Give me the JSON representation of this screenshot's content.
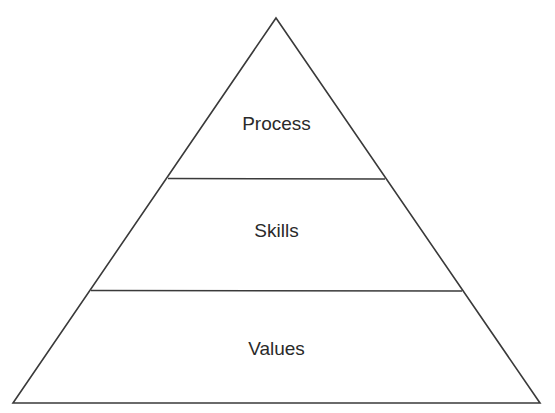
{
  "diagram": {
    "type": "pyramid",
    "tiers": [
      {
        "label": "Process",
        "position": "top"
      },
      {
        "label": "Skills",
        "position": "middle"
      },
      {
        "label": "Values",
        "position": "bottom"
      }
    ],
    "colors": {
      "stroke": "#3a3a3a",
      "text": "#2a2a2a",
      "background": "#ffffff"
    }
  }
}
